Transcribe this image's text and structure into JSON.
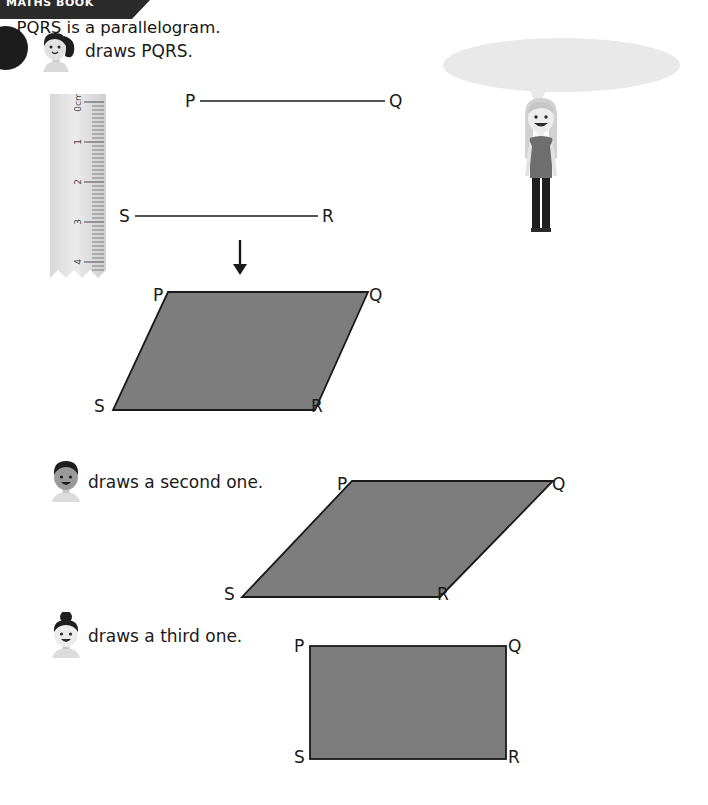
{
  "header": {
    "label": "MATHS BOOK"
  },
  "step": {
    "number": "1"
  },
  "instructions": [
    {
      "id": "step-1",
      "text": "draws PQRS.",
      "avatar": "girl-ponytail-avatar"
    },
    {
      "id": "step-2",
      "text": "draws a second one.",
      "avatar": "boy-short-hair-avatar"
    },
    {
      "id": "step-3",
      "text": "draws a third one.",
      "avatar": "girl-bun-avatar"
    }
  ],
  "speech": {
    "text": "PQRS is a parallelogram.",
    "speaker": "girl-long-hair-character"
  },
  "ruler": {
    "unit_label": "0cm",
    "ticks": [
      "0cm",
      "1",
      "2",
      "3",
      "4"
    ]
  },
  "line_segments": [
    {
      "name": "segment-pq",
      "start_label": "P",
      "end_label": "Q"
    },
    {
      "name": "segment-sr",
      "start_label": "S",
      "end_label": "R"
    }
  ],
  "arrow": {
    "direction": "down"
  },
  "figures": [
    {
      "name": "parallelogram-first",
      "type": "parallelogram",
      "vertex_labels": [
        "P",
        "Q",
        "S",
        "R"
      ],
      "fill": "#7d7d7d",
      "stroke": "#1a1a1a"
    },
    {
      "name": "parallelogram-second",
      "type": "parallelogram",
      "vertex_labels": [
        "P",
        "Q",
        "S",
        "R"
      ],
      "fill": "#7d7d7d",
      "stroke": "#1a1a1a"
    },
    {
      "name": "rectangle-third",
      "type": "rectangle",
      "vertex_labels": [
        "P",
        "Q",
        "S",
        "R"
      ],
      "fill": "#7d7d7d",
      "stroke": "#1a1a1a"
    }
  ],
  "colors": {
    "header_bar": "#2b2b2b",
    "badge": "#1c1c1c",
    "shape_fill": "#7d7d7d",
    "shape_stroke": "#1a1a1a",
    "bubble": "#e9e9e9",
    "page_background": "#ffffff"
  }
}
